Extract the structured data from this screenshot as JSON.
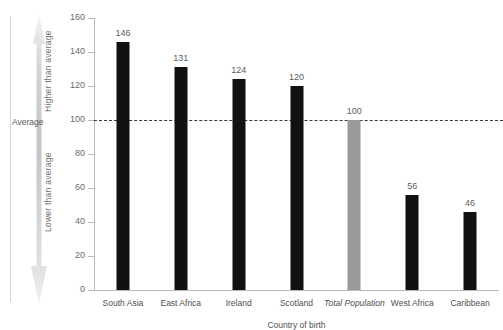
{
  "annotations": {
    "edge_clipped_label": "a)",
    "average_label": "Average",
    "higher_than_average": "Higher than average",
    "lower_than_average": "Lower than average"
  },
  "colors": {
    "bar_dark": "#111111",
    "bar_highlight": "#9a9a9a",
    "average_line": "#3a3a3a",
    "axis": "#b9b9b9",
    "arrow_gradient_top": "#efefef",
    "arrow_gradient_mid": "#c9c9c9",
    "arrow_gradient_bottom": "#e4e4e4"
  },
  "chart_data": {
    "type": "bar",
    "title": "",
    "subtitle": "",
    "xlabel": "Country of birth",
    "ylabel": "",
    "ylim": [
      0,
      160
    ],
    "yticks": [
      0,
      20,
      40,
      60,
      80,
      100,
      120,
      140,
      160
    ],
    "ytick_labels": [
      "0",
      "20",
      "40",
      "60",
      "80",
      "100",
      "120",
      "140",
      "160"
    ],
    "grid": false,
    "legend": "none",
    "categories": [
      "South Asia",
      "East Africa",
      "Ireland",
      "Scotland",
      "Total Population",
      "West Africa",
      "Caribbean"
    ],
    "category_styles": [
      "normal",
      "normal",
      "normal",
      "normal",
      "italic",
      "normal",
      "normal"
    ],
    "values": [
      146,
      131,
      124,
      120,
      100,
      56,
      46
    ],
    "value_labels": [
      "146",
      "131",
      "124",
      "120",
      "100",
      "56",
      "46"
    ],
    "bar_colors": [
      "#111111",
      "#111111",
      "#111111",
      "#111111",
      "#9a9a9a",
      "#111111",
      "#111111"
    ],
    "reference_line": {
      "value": 100,
      "label": "Average",
      "style": "dashed"
    },
    "annotations": [
      {
        "text": "Higher than average",
        "orientation": "vertical",
        "range": [
          100,
          160
        ]
      },
      {
        "text": "Lower than average",
        "orientation": "vertical",
        "range": [
          0,
          100
        ]
      }
    ]
  }
}
